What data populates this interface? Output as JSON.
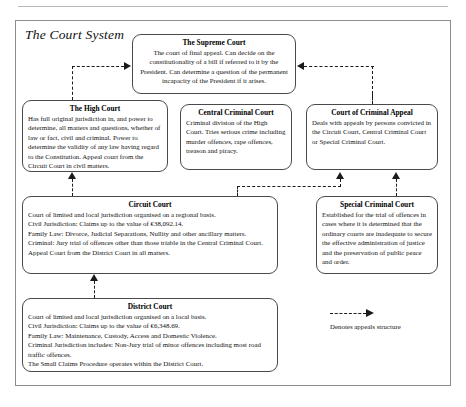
{
  "figure": {
    "title": "The Court System"
  },
  "boxes": {
    "supreme": {
      "title": "The Supreme Court",
      "body": "The court of final appeal. Can decide on the constitutionality of a bill if referred to it by the President. Can determine a question of the permanent incapacity of the President if it arises."
    },
    "high": {
      "title": "The High Court",
      "body": "Has full original jurisdiction in, and power to determine, all matters and questions, whether of law or fact, civil and criminal. Power to determine the validity of any law having regard to the Constitution. Appeal court from the Circuit Court in civil matters."
    },
    "central": {
      "title": "Central Criminal Court",
      "body": "Criminal division of the High Court. Tries serious crime including murder offences, rape offences, treason and piracy."
    },
    "criminal_appeal": {
      "title": "Court of Criminal Appeal",
      "body": "Deals with appeals by persons convicted in the Circuit Court, Central Criminal Court or Special Criminal Court."
    },
    "circuit": {
      "title": "Circuit Court",
      "lines": [
        "Court of limited and local jurisdiction organised on a regional basis.",
        "Civil Jurisdiction: Claims up to the value of €38,092.14.",
        "Family Law: Divorce, Judicial Separations, Nullity and other ancillary matters.",
        "Criminal: Jury trial of offences other than those triable in the Central Criminal Court.",
        "Appeal Court from the District Court in all matters."
      ]
    },
    "special": {
      "title": "Special Criminal Court",
      "body": "Established for the trial of offences in cases where it is determined that the ordinary courts are inadequate to secure the effective administration of justice and the preservation of public peace and order."
    },
    "district": {
      "title": "District Court",
      "lines": [
        "Court of limited and local jurisdiction organised on a local basis.",
        "Civil Jurisdiction: Claims up to the value of €6,348.69.",
        "Family Law: Maintenance, Custody, Access and Domestic Violence.",
        "Criminal Jurisdiction includes: Non-Jury trial of minor offences including most road traffic offences.",
        "The Small Claims Procedure operates within the District Court."
      ]
    }
  },
  "legend": {
    "label": "Denotes appeals structure"
  }
}
